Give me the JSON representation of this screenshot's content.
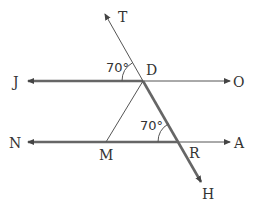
{
  "diagram": {
    "points": {
      "T": "T",
      "D": "D",
      "J": "J",
      "O": "O",
      "N": "N",
      "M": "M",
      "R": "R",
      "A": "A",
      "H": "H"
    },
    "angles": {
      "angle_at_D": "70°",
      "angle_at_R": "70°"
    },
    "lines": [
      {
        "name": "JO",
        "from": "J",
        "to": "O",
        "type": "line"
      },
      {
        "name": "NA",
        "from": "N",
        "to": "A",
        "type": "line"
      },
      {
        "name": "TH",
        "from": "T",
        "to": "H",
        "type": "line"
      },
      {
        "name": "DM",
        "from": "D",
        "to": "M",
        "type": "segment"
      }
    ],
    "colors": {
      "stroke": "#555555",
      "thick_stroke": "#666666",
      "text": "#333333"
    }
  }
}
